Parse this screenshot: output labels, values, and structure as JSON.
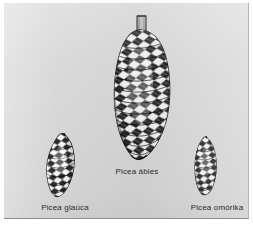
{
  "figure": {
    "type": "botanical-plate",
    "background_color": "#d9d9d9",
    "page_color": "#ffffff",
    "ink_color": "#1c1c1c"
  },
  "specimens": [
    {
      "id": "glauca",
      "caption": "Picea glaúca",
      "icon_name": "spruce-cone-glauca-illustration",
      "relative_size": "small",
      "shape": "ovoid, tapering, tilted",
      "position": "left"
    },
    {
      "id": "abies",
      "caption": "Picea ábies",
      "icon_name": "spruce-cone-abies-illustration",
      "relative_size": "large",
      "shape": "elongated cylindrical with stalk",
      "position": "center"
    },
    {
      "id": "omorika",
      "caption": "Picea omórika",
      "icon_name": "spruce-cone-omorika-illustration",
      "relative_size": "small",
      "shape": "narrow ellipsoid",
      "position": "right"
    }
  ]
}
